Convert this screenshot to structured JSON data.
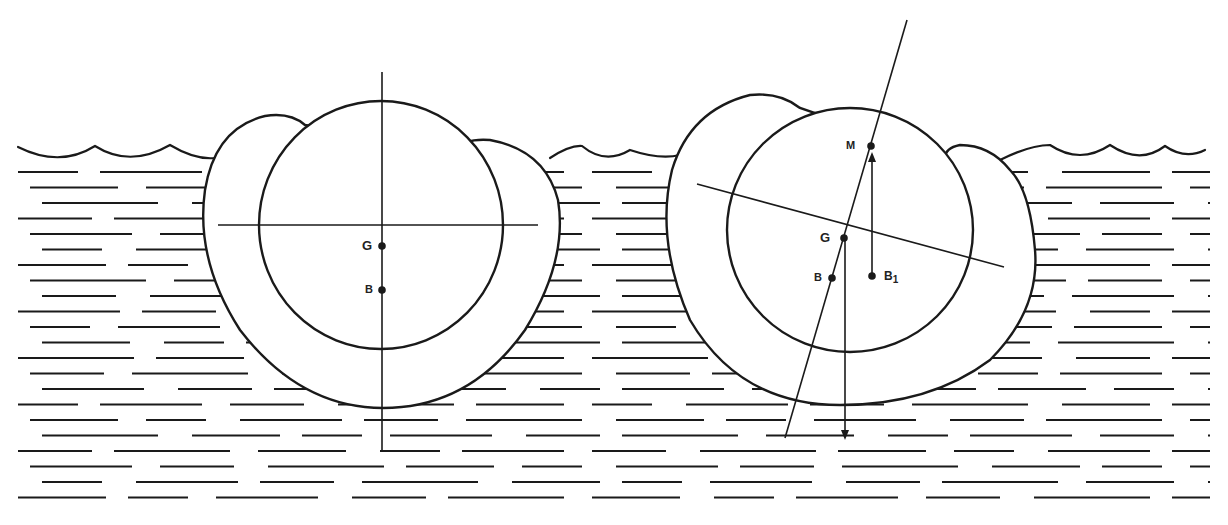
{
  "figure": {
    "left_vessel": {
      "state": "upright",
      "labels": {
        "center_of_gravity": "G",
        "center_of_buoyancy": "B"
      }
    },
    "right_vessel": {
      "state": "heeled",
      "labels": {
        "metacenter": "M",
        "center_of_gravity": "G",
        "center_of_buoyancy": "B",
        "shifted_buoyancy": "B",
        "shifted_buoyancy_sub": "1"
      }
    },
    "colors": {
      "ink": "#1a1a1a",
      "background": "#ffffff"
    }
  }
}
